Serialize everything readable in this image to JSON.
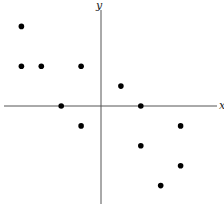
{
  "chart_data": {
    "type": "scatter",
    "title": "",
    "xlabel": "x",
    "ylabel": "y",
    "grid": false,
    "legend": null,
    "xlim": [
      -5,
      6
    ],
    "ylim": [
      -5,
      5
    ],
    "tick_labels": false,
    "points": [
      {
        "x": -4,
        "y": 4
      },
      {
        "x": -4,
        "y": 2
      },
      {
        "x": -3,
        "y": 2
      },
      {
        "x": -1,
        "y": 2
      },
      {
        "x": -2,
        "y": 0
      },
      {
        "x": -1,
        "y": -1
      },
      {
        "x": 1,
        "y": 1
      },
      {
        "x": 2,
        "y": 0
      },
      {
        "x": 4,
        "y": -1
      },
      {
        "x": 2,
        "y": -2
      },
      {
        "x": 4,
        "y": -3
      },
      {
        "x": 3,
        "y": -4
      }
    ]
  },
  "colors": {
    "axis": "#555555",
    "point": "#000000",
    "background": "#ffffff"
  }
}
